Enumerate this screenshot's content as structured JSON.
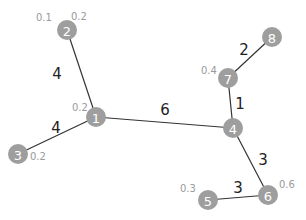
{
  "nodes": [
    {
      "id": "1",
      "x": 96,
      "y": 117
    },
    {
      "id": "2",
      "x": 67,
      "y": 30
    },
    {
      "id": "3",
      "x": 18,
      "y": 154
    },
    {
      "id": "4",
      "x": 233,
      "y": 128
    },
    {
      "id": "5",
      "x": 208,
      "y": 200
    },
    {
      "id": "6",
      "x": 268,
      "y": 195
    },
    {
      "id": "7",
      "x": 228,
      "y": 78
    },
    {
      "id": "8",
      "x": 272,
      "y": 37
    }
  ],
  "edges": [
    {
      "from": "2",
      "to": "1",
      "weight": "4",
      "lx": 57,
      "ly": 74
    },
    {
      "from": "3",
      "to": "1",
      "weight": "4",
      "lx": 56,
      "ly": 128
    },
    {
      "from": "1",
      "to": "4",
      "weight": "6",
      "lx": 165,
      "ly": 110
    },
    {
      "from": "7",
      "to": "4",
      "weight": "1",
      "lx": 240,
      "ly": 104
    },
    {
      "from": "7",
      "to": "8",
      "weight": "2",
      "lx": 244,
      "ly": 50
    },
    {
      "from": "4",
      "to": "6",
      "weight": "3",
      "lx": 263,
      "ly": 160
    },
    {
      "from": "5",
      "to": "6",
      "weight": "3",
      "lx": 238,
      "ly": 188
    }
  ],
  "node_labels": [
    {
      "text": "0.1",
      "x": 36,
      "y": 17
    },
    {
      "text": "0.2",
      "x": 71,
      "y": 16
    },
    {
      "text": "0.2",
      "x": 72,
      "y": 107
    },
    {
      "text": "0.2",
      "x": 30,
      "y": 156
    },
    {
      "text": "0.4",
      "x": 201,
      "y": 70
    },
    {
      "text": "0.3",
      "x": 180,
      "y": 188
    },
    {
      "text": "0.6",
      "x": 279,
      "y": 184
    }
  ],
  "colors": {
    "node": "#9e9e9e",
    "edge": "#333333",
    "node_label": "#9a9a9a"
  }
}
